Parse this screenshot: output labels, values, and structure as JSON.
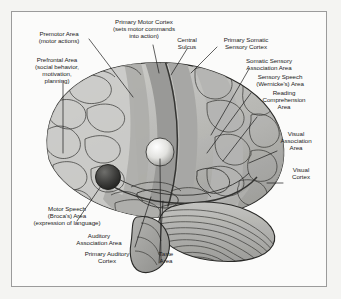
{
  "figure": {
    "frame_color": "#9b9b9b",
    "background_color": "#f4f4f2",
    "page_background": "#fbfbfa",
    "text_color": "#1b1b1b",
    "leader_line_color": "#1b1b1b"
  },
  "labels": {
    "premotor": "Premotor Area\n(motor actions)",
    "prefrontal": "Prefrontal Area\n(social behavior,\nmotivation,\nplanning)",
    "primary_motor": "Primary Motor Cortex\n(sets motor commands\ninto action)",
    "central_sulcus": "Central\nSulcus",
    "primary_somatic": "Primary Somatic\nSensory Cortex",
    "somatic_assoc": "Somatic Sensory\nAssociation Area",
    "wernicke": "Sensory Speech\n(Wernicke's) Area",
    "reading": "Reading\nComprehension\nArea",
    "visual_assoc": "Visual\nAssociation\nArea",
    "visual_cortex": "Visual\nCortex",
    "broca": "Motor Speech\n(Broca's) Area\n(expression of language)",
    "auditory_assoc": "Auditory\nAssociation Area",
    "primary_auditory": "Primary Auditory\nCortex",
    "taste": "Taste\nArea"
  },
  "brain_regions": {
    "cerebrum_fill": "#b9b9b6",
    "frontal_fill": "#c9c9c6",
    "motor_strip_fill": "#9a9a97",
    "sensory_strip_fill": "#a8a8a5",
    "temporal_fill": "#b0b0ad",
    "occipital_fill": "#a3a3a0",
    "cerebellum_fill": "#8f8f8c",
    "brainstem_fill": "#a6a6a3",
    "highlight_sphere_fill": "#ededea",
    "broca_sphere_fill": "#4a4a48",
    "outline_color": "#2a2a28"
  }
}
